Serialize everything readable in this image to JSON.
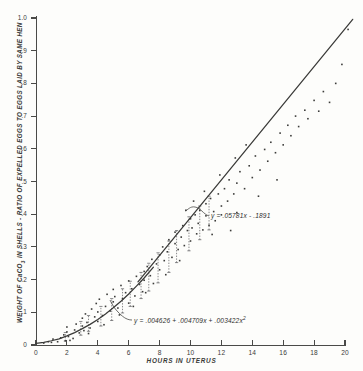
{
  "chart_data": {
    "type": "scatter",
    "title": "",
    "xlabel": "HOURS IN UTERUS",
    "ylabel": "WEIGHT OF CaCO3 IN SHELLS - RATIO OF EXPELLED EGGS TO EGGS LAID BY SAME HEN",
    "xlim": [
      0,
      20
    ],
    "ylim": [
      0,
      1.0
    ],
    "xticks": [
      0,
      2,
      4,
      6,
      8,
      10,
      12,
      14,
      16,
      18,
      20
    ],
    "xtick_labels": [
      "0",
      "2",
      "4",
      "6",
      "8",
      "10",
      "12",
      "14",
      "16",
      "18",
      "20"
    ],
    "yticks": [
      0,
      0.1,
      0.2,
      0.3,
      0.4,
      0.5,
      0.6,
      0.7,
      0.8,
      0.9,
      1.0
    ],
    "ytick_labels": [
      "0",
      ".1",
      ".2",
      ".3",
      ".4",
      ".5",
      ".6",
      ".7",
      ".8",
      ".9",
      "1.0"
    ],
    "grid": false,
    "legend": "none",
    "annotations": [
      {
        "name": "linear-fit-equation",
        "text": "y = .05781x - .1891",
        "x": 12.1,
        "y": 0.41
      },
      {
        "name": "quadratic-fit-equation",
        "text": "y = .004626 + .004709x + .003422x²",
        "x": 6.4,
        "y": 0.085
      }
    ],
    "series": [
      {
        "name": "quadratic-fit-curve",
        "type": "line",
        "equation": "y = .004626 + .004709x + .003422x^2",
        "x_range": [
          0,
          7.6
        ],
        "points": [
          [
            0.0,
            0.005
          ],
          [
            0.5,
            0.008
          ],
          [
            1.0,
            0.013
          ],
          [
            1.5,
            0.019
          ],
          [
            2.0,
            0.028
          ],
          [
            2.5,
            0.038
          ],
          [
            3.0,
            0.05
          ],
          [
            3.5,
            0.063
          ],
          [
            4.0,
            0.078
          ],
          [
            4.5,
            0.095
          ],
          [
            5.0,
            0.114
          ],
          [
            5.5,
            0.134
          ],
          [
            6.0,
            0.156
          ],
          [
            6.5,
            0.18
          ],
          [
            7.0,
            0.205
          ],
          [
            7.6,
            0.238
          ]
        ]
      },
      {
        "name": "linear-fit-line",
        "type": "line",
        "equation": "y = .05781x - .1891",
        "x_range": [
          6.6,
          20.5
        ],
        "points": [
          [
            6.6,
            0.193
          ],
          [
            20.5,
            0.996
          ]
        ]
      },
      {
        "name": "observed-data-points",
        "type": "scatter",
        "marker": "dot",
        "points": [
          [
            0.5,
            0.006
          ],
          [
            0.8,
            0.01
          ],
          [
            1.0,
            0.008
          ],
          [
            1.1,
            0.018
          ],
          [
            1.6,
            0.022
          ],
          [
            1.8,
            0.031
          ],
          [
            1.9,
            0.013
          ],
          [
            2.0,
            0.04
          ],
          [
            2.0,
            0.055
          ],
          [
            2.1,
            0.026
          ],
          [
            2.2,
            0.014
          ],
          [
            2.5,
            0.046
          ],
          [
            2.6,
            0.064
          ],
          [
            2.8,
            0.037
          ],
          [
            3.0,
            0.058
          ],
          [
            3.0,
            0.082
          ],
          [
            3.1,
            0.044
          ],
          [
            3.2,
            0.095
          ],
          [
            3.3,
            0.069
          ],
          [
            3.5,
            0.052
          ],
          [
            3.6,
            0.11
          ],
          [
            3.8,
            0.086
          ],
          [
            3.9,
            0.127
          ],
          [
            4.0,
            0.072
          ],
          [
            4.0,
            0.101
          ],
          [
            4.1,
            0.14
          ],
          [
            4.3,
            0.09
          ],
          [
            4.5,
            0.118
          ],
          [
            4.6,
            0.155
          ],
          [
            4.8,
            0.104
          ],
          [
            5.0,
            0.132
          ],
          [
            5.0,
            0.17
          ],
          [
            5.1,
            0.148
          ],
          [
            5.3,
            0.113
          ],
          [
            5.5,
            0.182
          ],
          [
            5.6,
            0.142
          ],
          [
            5.8,
            0.16
          ],
          [
            6.0,
            0.128
          ],
          [
            6.0,
            0.196
          ],
          [
            6.2,
            0.172
          ],
          [
            6.4,
            0.15
          ],
          [
            6.5,
            0.21
          ],
          [
            6.7,
            0.185
          ],
          [
            6.9,
            0.163
          ],
          [
            7.0,
            0.225
          ],
          [
            7.0,
            0.198
          ],
          [
            7.2,
            0.24
          ],
          [
            7.4,
            0.212
          ],
          [
            7.5,
            0.262
          ],
          [
            7.6,
            0.188
          ],
          [
            7.8,
            0.248
          ],
          [
            8.0,
            0.275
          ],
          [
            8.0,
            0.23
          ],
          [
            8.2,
            0.3
          ],
          [
            8.3,
            0.258
          ],
          [
            8.5,
            0.285
          ],
          [
            8.6,
            0.322
          ],
          [
            8.8,
            0.268
          ],
          [
            9.0,
            0.31
          ],
          [
            9.0,
            0.345
          ],
          [
            9.2,
            0.292
          ],
          [
            9.4,
            0.33
          ],
          [
            9.5,
            0.365
          ],
          [
            9.6,
            0.304
          ],
          [
            9.8,
            0.35
          ],
          [
            10.0,
            0.318
          ],
          [
            10.0,
            0.386
          ],
          [
            10.1,
            0.358
          ],
          [
            10.3,
            0.398
          ],
          [
            10.4,
            0.34
          ],
          [
            10.5,
            0.372
          ],
          [
            10.6,
            0.412
          ],
          [
            10.8,
            0.352
          ],
          [
            11.0,
            0.395
          ],
          [
            11.0,
            0.432
          ],
          [
            11.2,
            0.366
          ],
          [
            11.3,
            0.448
          ],
          [
            11.5,
            0.408
          ],
          [
            11.6,
            0.38
          ],
          [
            11.8,
            0.462
          ],
          [
            12.0,
            0.425
          ],
          [
            12.0,
            0.398
          ],
          [
            12.2,
            0.478
          ],
          [
            12.4,
            0.44
          ],
          [
            12.5,
            0.505
          ],
          [
            12.8,
            0.462
          ],
          [
            13.0,
            0.495
          ],
          [
            13.2,
            0.53
          ],
          [
            13.5,
            0.478
          ],
          [
            13.8,
            0.548
          ],
          [
            14.0,
            0.512
          ],
          [
            14.2,
            0.578
          ],
          [
            14.5,
            0.535
          ],
          [
            14.8,
            0.598
          ],
          [
            15.0,
            0.562
          ],
          [
            15.2,
            0.62
          ],
          [
            15.5,
            0.588
          ],
          [
            15.8,
            0.648
          ],
          [
            16.0,
            0.612
          ],
          [
            16.3,
            0.672
          ],
          [
            16.5,
            0.64
          ],
          [
            16.8,
            0.7
          ],
          [
            17.0,
            0.668
          ],
          [
            17.4,
            0.718
          ],
          [
            17.6,
            0.692
          ],
          [
            18.0,
            0.748
          ],
          [
            18.3,
            0.715
          ],
          [
            18.6,
            0.775
          ],
          [
            19.0,
            0.742
          ],
          [
            19.4,
            0.8
          ],
          [
            19.8,
            0.858
          ],
          [
            20.2,
            0.965
          ],
          [
            12.6,
            0.35
          ],
          [
            13.0,
            0.405
          ],
          [
            11.4,
            0.338
          ],
          [
            14.4,
            0.455
          ],
          [
            15.6,
            0.505
          ],
          [
            9.3,
            0.258
          ],
          [
            8.4,
            0.215
          ],
          [
            7.1,
            0.16
          ],
          [
            6.3,
            0.118
          ],
          [
            5.4,
            0.092
          ],
          [
            4.4,
            0.062
          ],
          [
            3.4,
            0.035
          ],
          [
            2.4,
            0.02
          ],
          [
            1.4,
            0.01
          ],
          [
            13.6,
            0.612
          ],
          [
            12.9,
            0.572
          ],
          [
            11.9,
            0.52
          ],
          [
            10.9,
            0.47
          ],
          [
            10.2,
            0.44
          ],
          [
            9.7,
            0.412
          ]
        ]
      },
      {
        "name": "error-bar-markers",
        "type": "errorbar",
        "bars": [
          [
            1.9,
            0.012,
            0.038
          ],
          [
            2.9,
            0.03,
            0.072
          ],
          [
            3.4,
            0.042,
            0.09
          ],
          [
            4.2,
            0.058,
            0.118
          ],
          [
            4.9,
            0.075,
            0.142
          ],
          [
            5.6,
            0.098,
            0.172
          ],
          [
            6.1,
            0.118,
            0.195
          ],
          [
            6.8,
            0.142,
            0.222
          ],
          [
            7.3,
            0.165,
            0.25
          ],
          [
            7.9,
            0.19,
            0.282
          ],
          [
            8.6,
            0.222,
            0.318
          ],
          [
            9.1,
            0.252,
            0.35
          ],
          [
            9.9,
            0.288,
            0.392
          ],
          [
            10.6,
            0.322,
            0.425
          ],
          [
            11.2,
            0.352,
            0.455
          ]
        ]
      }
    ]
  }
}
